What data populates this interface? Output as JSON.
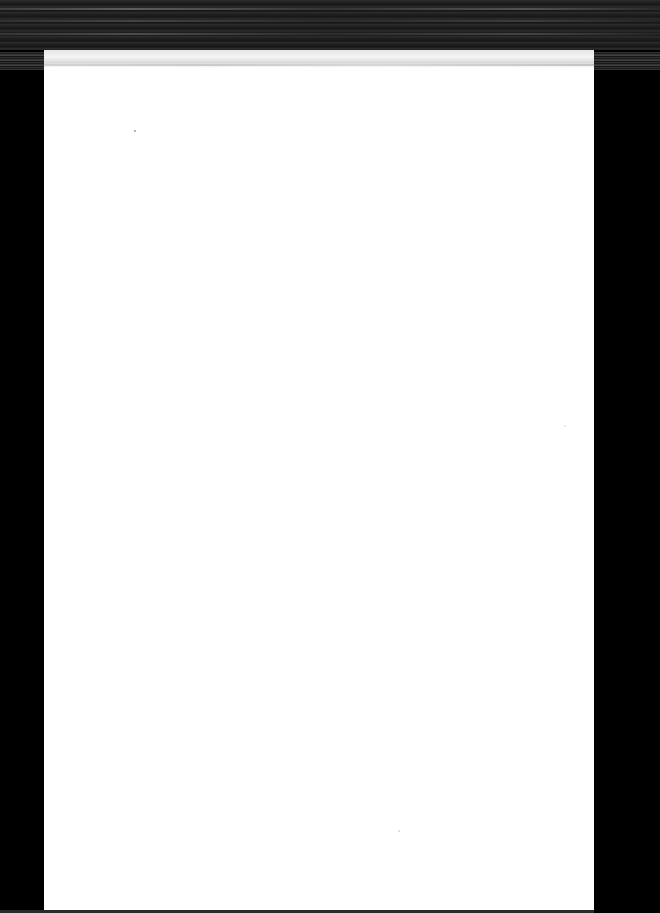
{
  "document": {
    "type": "scanned-page",
    "page_content": "",
    "colors": {
      "page": "#ffffff",
      "scanner_background": "#000000",
      "top_noise": "#2a2a2a"
    }
  }
}
